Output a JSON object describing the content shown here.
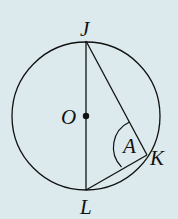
{
  "diagram": {
    "type": "circle-geometry",
    "background": "#dceaed",
    "circle": {
      "center_label": "O",
      "cx": 86,
      "cy": 116,
      "r": 74
    },
    "points": [
      {
        "label": "J",
        "x": 86,
        "y": 41
      },
      {
        "label": "L",
        "x": 86,
        "y": 190
      },
      {
        "label": "K",
        "x": 147,
        "y": 155
      },
      {
        "label": "O",
        "x": 86,
        "y": 116
      }
    ],
    "segments": [
      [
        "J",
        "L"
      ],
      [
        "J",
        "K"
      ],
      [
        "L",
        "K"
      ]
    ],
    "angle": {
      "vertex": "K",
      "label": "A"
    },
    "labels": {
      "J": "J",
      "O": "O",
      "L": "L",
      "K": "K",
      "A": "A"
    }
  }
}
